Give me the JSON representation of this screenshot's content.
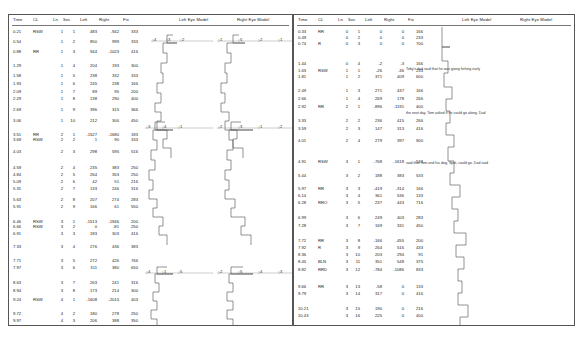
{
  "document": {
    "title": "Eye Movement Recording Charts",
    "panel_count": 2
  },
  "columns": [
    "Time",
    "CL",
    "Ln",
    "Sec",
    "Left",
    "Right",
    "Fix"
  ],
  "plot_titles": {
    "left_eye": "Left Eye Model",
    "right_eye": "Right Eye Model"
  },
  "colors": {
    "ink": "#1b1b1b",
    "border": "#555555",
    "trace": "#444444",
    "axis": "#888888"
  },
  "chart_data": {
    "type": "line",
    "xlabel": "Regression / Fixation Position (scale 1-5)",
    "ylabel": "Reading Line / Time",
    "grid": false,
    "legend": "none",
    "axis_ticks_descending": [
      5,
      4,
      3,
      2,
      1
    ],
    "panels": [
      {
        "name": "panel-left",
        "rows": [
          {
            "time": "0.21",
            "cl": "RSW",
            "ln": "1",
            "sec": "1",
            "left": "483",
            "right": "-942",
            "fix": "333"
          },
          {
            "time": "0.54",
            "cl": "",
            "ln": "1",
            "sec": "2",
            "left": "850",
            "right": "999",
            "fix": "333"
          },
          {
            "time": "0.88",
            "cl": "RR",
            "ln": "1",
            "sec": "3",
            "left": "944",
            "right": "-1023",
            "fix": "416"
          },
          {
            "time": "1.29",
            "cl": "",
            "ln": "1",
            "sec": "4",
            "left": "204",
            "right": "193",
            "fix": "300"
          },
          {
            "time": "1.58",
            "cl": "",
            "ln": "1",
            "sec": "5",
            "left": "238",
            "right": "332",
            "fix": "333"
          },
          {
            "time": "1.93",
            "cl": "",
            "ln": "1",
            "sec": "6",
            "left": "245",
            "right": "238",
            "fix": "166"
          },
          {
            "time": "2.09",
            "cl": "",
            "ln": "1",
            "sec": "7",
            "left": "89",
            "right": "95",
            "fix": "200"
          },
          {
            "time": "2.29",
            "cl": "",
            "ln": "1",
            "sec": "8",
            "left": "138",
            "right": "290",
            "fix": "400"
          },
          {
            "time": "2.69",
            "cl": "",
            "ln": "1",
            "sec": "9",
            "left": "396",
            "right": "315",
            "fix": "366"
          },
          {
            "time": "3.06",
            "cl": "",
            "ln": "1",
            "sec": "10",
            "left": "212",
            "right": "300",
            "fix": "450"
          },
          {
            "time": "3.51",
            "cl": "RR",
            "ln": "2",
            "sec": "1",
            "left": "-1527",
            "right": "-1680",
            "fix": "183"
          },
          {
            "time": "3.69",
            "cl": "RSW",
            "ln": "2",
            "sec": "2",
            "left": "1",
            "right": "90",
            "fix": "333"
          },
          {
            "time": "4.03",
            "cl": "",
            "ln": "2",
            "sec": "3",
            "left": "298",
            "right": "595",
            "fix": "516"
          },
          {
            "time": "4.59",
            "cl": "",
            "ln": "2",
            "sec": "4",
            "left": "235",
            "right": "383",
            "fix": "250"
          },
          {
            "time": "4.84",
            "cl": "",
            "ln": "2",
            "sec": "5",
            "left": "264",
            "right": "353",
            "fix": "250"
          },
          {
            "time": "5.09",
            "cl": "",
            "ln": "2",
            "sec": "6",
            "left": "42",
            "right": "51",
            "fix": "216"
          },
          {
            "time": "5.31",
            "cl": "",
            "ln": "2",
            "sec": "7",
            "left": "133",
            "right": "246",
            "fix": "316"
          },
          {
            "time": "5.63",
            "cl": "",
            "ln": "2",
            "sec": "8",
            "left": "207",
            "right": "274",
            "fix": "283"
          },
          {
            "time": "5.91",
            "cl": "",
            "ln": "2",
            "sec": "9",
            "left": "166",
            "right": "61",
            "fix": "550"
          },
          {
            "time": "6.46",
            "cl": "RSW",
            "ln": "3",
            "sec": "1",
            "left": "-1513",
            "right": "-1946",
            "fix": "200"
          },
          {
            "time": "6.66",
            "cl": "RSW",
            "ln": "3",
            "sec": "2",
            "left": "0",
            "right": "-81",
            "fix": "250"
          },
          {
            "time": "6.91",
            "cl": "",
            "ln": "3",
            "sec": "3",
            "left": "183",
            "right": "303",
            "fix": "416"
          },
          {
            "time": "7.33",
            "cl": "",
            "ln": "3",
            "sec": "4",
            "left": "276",
            "right": "436",
            "fix": "383"
          },
          {
            "time": "7.71",
            "cl": "",
            "ln": "3",
            "sec": "5",
            "left": "272",
            "right": "426",
            "fix": "766"
          },
          {
            "time": "7.97",
            "cl": "",
            "ln": "3",
            "sec": "6",
            "left": "311",
            "right": "380",
            "fix": "650"
          },
          {
            "time": "8.63",
            "cl": "",
            "ln": "3",
            "sec": "7",
            "left": "263",
            "right": "241",
            "fix": "316"
          },
          {
            "time": "8.94",
            "cl": "",
            "ln": "3",
            "sec": "8",
            "left": "173",
            "right": "214",
            "fix": "300"
          },
          {
            "time": "9.24",
            "cl": "RSW",
            "ln": "4",
            "sec": "1",
            "left": "-1608",
            "right": "-2015",
            "fix": "403"
          },
          {
            "time": "9.72",
            "cl": "",
            "ln": "4",
            "sec": "2",
            "left": "180",
            "right": "278",
            "fix": "250"
          },
          {
            "time": "9.97",
            "cl": "",
            "ln": "4",
            "sec": "3",
            "left": "206",
            "right": "388",
            "fix": "350"
          },
          {
            "time": "10.32",
            "cl": "",
            "ln": "4",
            "sec": "4",
            "left": "307",
            "right": "425",
            "fix": "200"
          },
          {
            "time": "10.53",
            "cl": "BLN",
            "ln": "4",
            "sec": "5",
            "left": "334",
            "right": "133",
            "fix": "525"
          }
        ],
        "annotations": []
      },
      {
        "name": "panel-right",
        "rows": [
          {
            "time": "0.33",
            "cl": "RR",
            "ln": "0",
            "sec": "1",
            "left": "0",
            "right": "0",
            "fix": "166"
          },
          {
            "time": "0.49",
            "cl": "",
            "ln": "0",
            "sec": "2",
            "left": "0",
            "right": "0",
            "fix": "233"
          },
          {
            "time": "0.74",
            "cl": "R",
            "ln": "0",
            "sec": "3",
            "left": "0",
            "right": "0",
            "fix": "700"
          },
          {
            "time": "1.44",
            "cl": "",
            "ln": "0",
            "sec": "4",
            "left": "-2",
            "right": "-3",
            "fix": "166"
          },
          {
            "time": "1.63",
            "cl": "RSW",
            "ln": "1",
            "sec": "1",
            "left": "-26",
            "right": "-36",
            "fix": "233"
          },
          {
            "time": "1.81",
            "cl": "",
            "ln": "1",
            "sec": "2",
            "left": "371",
            "right": "409",
            "fix": "600"
          },
          {
            "time": "2.49",
            "cl": "",
            "ln": "1",
            "sec": "3",
            "left": "271",
            "right": "437",
            "fix": "166"
          },
          {
            "time": "2.66",
            "cl": "",
            "ln": "1",
            "sec": "4",
            "left": "269",
            "right": "178",
            "fix": "266"
          },
          {
            "time": "2.92",
            "cl": "RR",
            "ln": "2",
            "sec": "1",
            "left": "-896",
            "right": "-1191",
            "fix": "400"
          },
          {
            "time": "3.33",
            "cl": "",
            "ln": "2",
            "sec": "2",
            "left": "236",
            "right": "415",
            "fix": "266"
          },
          {
            "time": "3.59",
            "cl": "",
            "ln": "2",
            "sec": "3",
            "left": "147",
            "right": "313",
            "fix": "416"
          },
          {
            "time": "4.01",
            "cl": "",
            "ln": "2",
            "sec": "4",
            "left": "279",
            "right": "397",
            "fix": "900"
          },
          {
            "time": "4.91",
            "cl": "RSW",
            "ln": "3",
            "sec": "1",
            "left": "-768",
            "right": "-1618",
            "fix": "533"
          },
          {
            "time": "5.44",
            "cl": "",
            "ln": "3",
            "sec": "2",
            "left": "188",
            "right": "383",
            "fix": "533"
          },
          {
            "time": "5.97",
            "cl": "RR",
            "ln": "3",
            "sec": "3",
            "left": "-419",
            "right": "-314",
            "fix": "166"
          },
          {
            "time": "6.14",
            "cl": "",
            "ln": "3",
            "sec": "4",
            "left": "361",
            "right": "536",
            "fix": "133"
          },
          {
            "time": "6.28",
            "cl": "RRO",
            "ln": "3",
            "sec": "5",
            "left": "237",
            "right": "443",
            "fix": "716"
          },
          {
            "time": "6.99",
            "cl": "",
            "ln": "3",
            "sec": "6",
            "left": "249",
            "right": "403",
            "fix": "283"
          },
          {
            "time": "7.28",
            "cl": "",
            "ln": "3",
            "sec": "7",
            "left": "169",
            "right": "331",
            "fix": "450"
          },
          {
            "time": "7.72",
            "cl": "RR",
            "ln": "3",
            "sec": "8",
            "left": "-166",
            "right": "-455",
            "fix": "200"
          },
          {
            "time": "7.92",
            "cl": "R",
            "ln": "3",
            "sec": "9",
            "left": "264",
            "right": "516",
            "fix": "433"
          },
          {
            "time": "8.36",
            "cl": "",
            "ln": "3",
            "sec": "10",
            "left": "203",
            "right": "294",
            "fix": "91"
          },
          {
            "time": "8.45",
            "cl": "BLN",
            "ln": "3",
            "sec": "11",
            "left": "351",
            "right": "548",
            "fix": "375"
          },
          {
            "time": "8.82",
            "cl": "RRD",
            "ln": "3",
            "sec": "12",
            "left": "-784",
            "right": "-1086",
            "fix": "833"
          },
          {
            "time": "9.66",
            "cl": "RR",
            "ln": "3",
            "sec": "13",
            "left": "-58",
            "right": "0",
            "fix": "133"
          },
          {
            "time": "9.79",
            "cl": "",
            "ln": "3",
            "sec": "14",
            "left": "317",
            "right": "0",
            "fix": "416"
          },
          {
            "time": "10.21",
            "cl": "",
            "ln": "3",
            "sec": "15",
            "left": "190",
            "right": "0",
            "fix": "216"
          },
          {
            "time": "10.43",
            "cl": "",
            "ln": "3",
            "sec": "16",
            "left": "225",
            "right": "0",
            "fix": "400"
          },
          {
            "time": "10.92",
            "cl": "",
            "ln": "3",
            "sec": "17",
            "left": "211",
            "right": "154",
            "fix": "183"
          }
        ],
        "annotations": [
          "Toby's dad said that he was going fishing early",
          "the next day.  Tom asked if he could go along.  Dad",
          "said that Tom and his dog, Spot, could go.  Dad said"
        ]
      }
    ]
  }
}
